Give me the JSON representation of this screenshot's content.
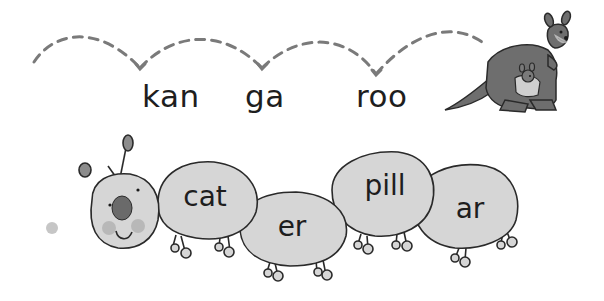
{
  "syllable_row": {
    "word": "kangaroo",
    "syllables": [
      {
        "text": "kan",
        "x": 142,
        "y": 53
      },
      {
        "text": "ga",
        "x": 245,
        "y": 53
      },
      {
        "text": "roo",
        "x": 356,
        "y": 53
      }
    ],
    "image": "kangaroo-with-joey"
  },
  "caterpillar": {
    "word": "caterpillar",
    "segments": [
      {
        "text": "cat",
        "cx": 205,
        "cy": 198
      },
      {
        "text": "er",
        "cx": 294,
        "cy": 227
      },
      {
        "text": "pill",
        "cx": 383,
        "cy": 193
      },
      {
        "text": "ar",
        "cx": 470,
        "cy": 210
      }
    ]
  },
  "colors": {
    "segment_fill": "#d6d6d6",
    "outline": "#2a2a2a",
    "dash": "#7a7a7a",
    "kangaroo": "#6e6e6e",
    "nose": "#6a6a6a",
    "cheek": "#b8b8b8"
  }
}
